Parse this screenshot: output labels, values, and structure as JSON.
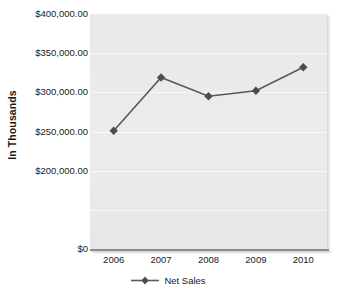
{
  "chart_data": {
    "type": "line",
    "title": "",
    "xlabel": "",
    "ylabel": "In Thousands",
    "categories": [
      "2006",
      "2007",
      "2008",
      "2009",
      "2010"
    ],
    "series": [
      {
        "name": "Net Sales",
        "values": [
          251000,
          319000,
          295000,
          302000,
          332000
        ]
      }
    ],
    "y_tick_labels": [
      "$400,000.00",
      "$350,000.00",
      "$300,000.00",
      "$250,000.00",
      "$200,000.00",
      "$0"
    ],
    "y_tick_values": [
      400000,
      350000,
      300000,
      250000,
      200000,
      0
    ],
    "ylim": [
      0,
      400000
    ],
    "axis_note": "y-axis is broken: even $50,000 steps from $400,000.00 down to $200,000.00, then a compressed gap with one unlabeled gridline before $0",
    "grid": true,
    "legend_position": "bottom",
    "marker": "diamond",
    "colors": {
      "line": "#595959",
      "marker": "#4d4d4d",
      "plot_background": "#eaeaea",
      "gridline": "#f8f8f8",
      "axis_line": "#8c8c8c",
      "text": "#1a1a1a",
      "page_background": "#ffffff"
    }
  },
  "legend": {
    "entries": [
      {
        "label": "Net Sales"
      }
    ]
  }
}
